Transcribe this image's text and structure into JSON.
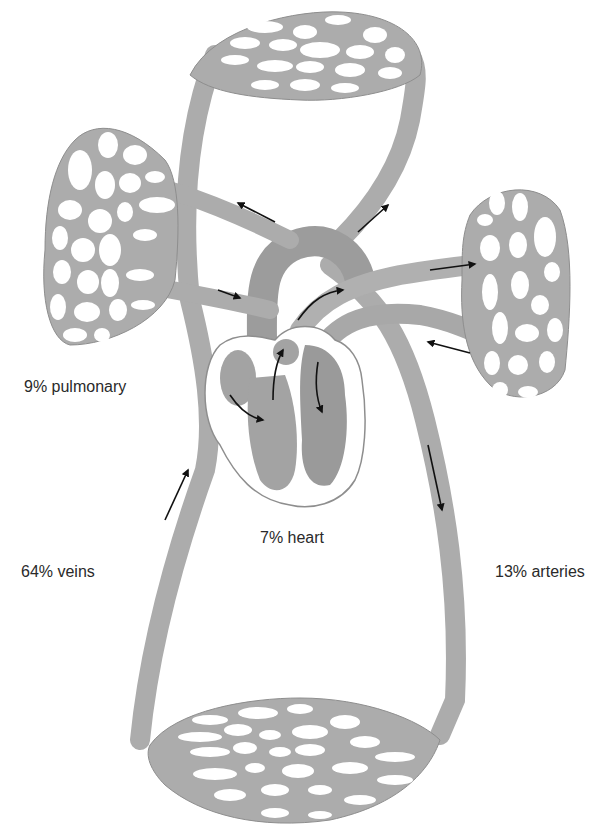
{
  "diagram": {
    "colors": {
      "vessel": "#acacac",
      "vessel_dark": "#9a9a9a",
      "vessel_edge": "#8e8e8e",
      "heart_chamber": "#a3a3a3",
      "background": "#ffffff",
      "arrow": "#111111",
      "text": "#2a2a2a"
    },
    "labels": {
      "pulmonary": "9% pulmonary",
      "heart": "7% heart",
      "veins": "64% veins",
      "arteries": "13% arteries"
    },
    "capillary_beds": [
      {
        "id": "top",
        "region": "upper body"
      },
      {
        "id": "left-lung",
        "region": "left lung"
      },
      {
        "id": "right-lung",
        "region": "right lung"
      },
      {
        "id": "bottom",
        "region": "lower body"
      }
    ],
    "heart": {
      "chambers": [
        "right-atrium",
        "right-ventricle",
        "left-atrium",
        "left-ventricle"
      ]
    }
  }
}
